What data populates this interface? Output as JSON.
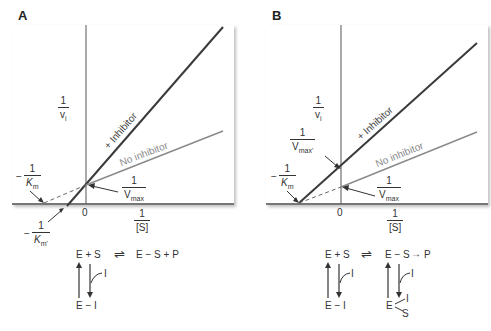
{
  "panels": [
    {
      "label": "A",
      "y_axis": {
        "num": "1",
        "den": "v",
        "den_sub": "i"
      },
      "x_axis": {
        "num": "1",
        "den": "[S]",
        "zero": "0"
      },
      "lines": {
        "inhibitor": "+ Inhibitor",
        "no_inhibitor": "No inhibitor"
      },
      "annotations": {
        "neg_km": {
          "sign": "−",
          "num": "1",
          "den": "K",
          "den_sub": "m"
        },
        "neg_km_prime": {
          "sign": "−",
          "num": "1",
          "den": "K",
          "den_sub": "m'"
        },
        "inv_vmax": {
          "num": "1",
          "den": "V",
          "den_sub": "max"
        }
      },
      "scheme": {
        "left": "E + S",
        "equilibrium": "⇌",
        "right": "E − S + P",
        "inhibitor": "I",
        "complex": "E − I"
      }
    },
    {
      "label": "B",
      "y_axis": {
        "num": "1",
        "den": "v",
        "den_sub": "i"
      },
      "x_axis": {
        "num": "1",
        "den": "[S]",
        "zero": "0"
      },
      "lines": {
        "inhibitor": "+ Inhibitor",
        "no_inhibitor": "No inhibitor"
      },
      "annotations": {
        "neg_km": {
          "sign": "−",
          "num": "1",
          "den": "K",
          "den_sub": "m"
        },
        "inv_vmax_prime": {
          "num": "1",
          "den": "V",
          "den_sub": "max'"
        },
        "inv_vmax": {
          "num": "1",
          "den": "V",
          "den_sub": "max"
        }
      },
      "scheme": {
        "left": "E + S",
        "equilibrium": "⇌",
        "middle": "E − S",
        "arrow": "→",
        "product": "P",
        "inhibitor1": "I",
        "inhibitor2": "I",
        "complex1": "E − I",
        "complex2_e": "E",
        "complex2_i": "I",
        "complex2_s": "S"
      }
    }
  ],
  "colors": {
    "inhibitor_line": "#3a3a3a",
    "no_inhibitor_line": "#8a8a8a",
    "axis": "#555555"
  }
}
